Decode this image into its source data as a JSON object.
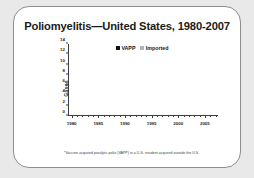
{
  "slide": {
    "title": "Poliomyelitis—United States, 1980-2007",
    "footnote": "*Vaccine-acquired paralytic polio (VAPP) in a U.S. resident acquired outside the U.S."
  },
  "legend": {
    "vapp_label": "VAPP",
    "imported_label": "Imported"
  },
  "colors": {
    "vapp": "#121212",
    "imported": "#a8a8a8",
    "axis": "#3c3c3c",
    "card_background": "#ffffff",
    "page_background": "#e9e9e9",
    "title_text": "#1b1b1b"
  },
  "chart_data": {
    "type": "bar",
    "title": "Poliomyelitis—United States, 1980-2007",
    "xlabel": "",
    "ylabel": "Cases",
    "ylim": [
      0,
      14
    ],
    "yticks": [
      0,
      2,
      4,
      6,
      8,
      10,
      12,
      14
    ],
    "xticks": [
      "1980",
      "1985",
      "1990",
      "1995",
      "2000",
      "2005"
    ],
    "grid": false,
    "legend_position": "top-center",
    "stacked": true,
    "categories": [
      "1980",
      "1981",
      "1982",
      "1983",
      "1984",
      "1985",
      "1986",
      "1987",
      "1988",
      "1989",
      "1990",
      "1991",
      "1992",
      "1993",
      "1994",
      "1995",
      "1996",
      "1997",
      "1998",
      "1999",
      "2000",
      "2001",
      "2002",
      "2003",
      "2004",
      "2005",
      "2006",
      "2007"
    ],
    "series": [
      {
        "name": "VAPP",
        "color": "#121212",
        "values": [
          6,
          10,
          12,
          13,
          8,
          7,
          9,
          9,
          9,
          11,
          6,
          9,
          6,
          3,
          8,
          6,
          7,
          7,
          2,
          2,
          0,
          0,
          0,
          0,
          0,
          1,
          0,
          0
        ]
      },
      {
        "name": "Imported",
        "color": "#a8a8a8",
        "values": [
          3,
          0,
          0,
          0,
          1,
          1,
          0,
          0,
          0,
          0,
          4,
          1,
          0,
          1,
          0,
          0,
          0,
          0,
          0,
          0,
          0,
          0,
          0,
          0,
          0,
          1,
          0,
          0
        ]
      }
    ]
  }
}
